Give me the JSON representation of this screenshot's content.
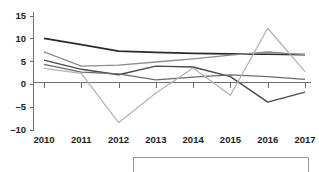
{
  "chart_data": {
    "type": "line",
    "title": "",
    "subtitle": "",
    "xlabel": "",
    "ylabel": "",
    "categories": [
      "2010",
      "2011",
      "2012",
      "2013",
      "2014",
      "2015",
      "2016",
      "2017"
    ],
    "x": [
      2010,
      2011,
      2012,
      2013,
      2014,
      2015,
      2016,
      2017
    ],
    "ylim": [
      -10,
      15
    ],
    "yticks": [
      -10,
      -5,
      0,
      5,
      10,
      15
    ],
    "ytick_labels": [
      "–10",
      "–5",
      "0",
      "5",
      "10",
      "15"
    ],
    "grid": false,
    "legend_position": "bottom",
    "zero_line": true,
    "series": [
      {
        "name": "series-1",
        "color": "#2b2b2b",
        "width": 1.7,
        "values": [
          10.0,
          8.6,
          7.2,
          6.9,
          6.7,
          6.6,
          6.5,
          6.4
        ]
      },
      {
        "name": "series-2",
        "color": "#8c8c8c",
        "width": 1.3,
        "values": [
          7.0,
          3.9,
          4.1,
          4.8,
          5.5,
          6.3,
          7.0,
          6.4
        ]
      },
      {
        "name": "series-3",
        "color": "#4a4a4a",
        "width": 1.4,
        "values": [
          5.2,
          3.2,
          2.0,
          3.9,
          3.7,
          1.6,
          -4.0,
          -1.8
        ]
      },
      {
        "name": "series-4",
        "color": "#6b6b6b",
        "width": 1.3,
        "values": [
          4.3,
          2.6,
          2.2,
          0.9,
          1.5,
          2.0,
          1.6,
          1.0
        ]
      },
      {
        "name": "series-5",
        "color": "#b4b4b4",
        "width": 1.3,
        "values": [
          3.4,
          2.3,
          -8.5,
          -2.0,
          3.5,
          -2.5,
          12.2,
          2.7
        ]
      }
    ],
    "legend_entries": []
  },
  "axis": {
    "y_labels": [
      "15",
      "10",
      "5",
      "0",
      "–5",
      "–10"
    ],
    "x_labels": [
      "2010",
      "2011",
      "2012",
      "2013",
      "2014",
      "2015",
      "2016",
      "2017"
    ]
  },
  "colors": {
    "axis": "#6e6e6e",
    "text": "#1c1c1c",
    "background": "#ffffff",
    "legend_border": "#9a9a9a"
  }
}
